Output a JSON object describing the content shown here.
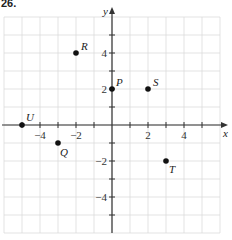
{
  "problem_number": "26.",
  "chart_data": {
    "type": "scatter",
    "title": "",
    "xlabel": "x",
    "ylabel": "y",
    "xlim": [
      -6,
      6
    ],
    "ylim": [
      -6,
      6
    ],
    "grid": true,
    "x_ticks": [
      -4,
      -2,
      2,
      4
    ],
    "y_ticks": [
      4,
      2,
      -2,
      -4
    ],
    "points": [
      {
        "label": "P",
        "x": 0,
        "y": 2
      },
      {
        "label": "Q",
        "x": -3,
        "y": -1
      },
      {
        "label": "R",
        "x": -2,
        "y": 4
      },
      {
        "label": "S",
        "x": 2,
        "y": 2
      },
      {
        "label": "T",
        "x": 3,
        "y": -2
      },
      {
        "label": "U",
        "x": -5,
        "y": 0
      }
    ]
  }
}
